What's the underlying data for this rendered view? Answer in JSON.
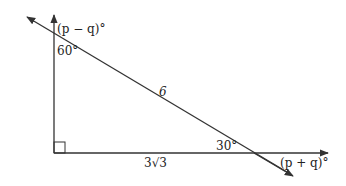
{
  "diagram": {
    "type": "right-triangle-with-extended-lines",
    "labels": {
      "top_exterior_angle": "(p − q)°",
      "top_interior_angle": "60°",
      "hypotenuse": "6",
      "bottom_interior_angle": "30°",
      "base": "3√3",
      "bottom_exterior_angle": "(p + q)°"
    },
    "line_color": "#333333"
  }
}
